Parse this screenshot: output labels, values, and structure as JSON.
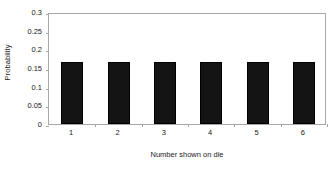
{
  "chart_data": {
    "type": "bar",
    "title": "",
    "subtitle": "",
    "xlabel": "Number shown on die",
    "ylabel": "Probability",
    "categories": [
      "1",
      "2",
      "3",
      "4",
      "5",
      "6"
    ],
    "values": [
      0.167,
      0.167,
      0.167,
      0.167,
      0.167,
      0.167
    ],
    "series": [
      {
        "name": "Probability",
        "values": [
          0.167,
          0.167,
          0.167,
          0.167,
          0.167,
          0.167
        ]
      }
    ],
    "ylim": [
      0,
      0.3
    ],
    "ytick_labels": [
      "0",
      "0.05",
      "0.1",
      "0.15",
      "0.2",
      "0.25",
      "0.3"
    ],
    "ytick_values": [
      0,
      0.05,
      0.1,
      0.15,
      0.2,
      0.25,
      0.3
    ],
    "xtick_labels": [
      "1",
      "2",
      "3",
      "4",
      "5",
      "6"
    ],
    "grid": false,
    "legend": false,
    "legend_position": "none",
    "bar_color": "#141414",
    "axis_color": "#a8a8a8",
    "text_color": "#1a1a1a",
    "background_color": "#ffffff",
    "annotations": []
  }
}
